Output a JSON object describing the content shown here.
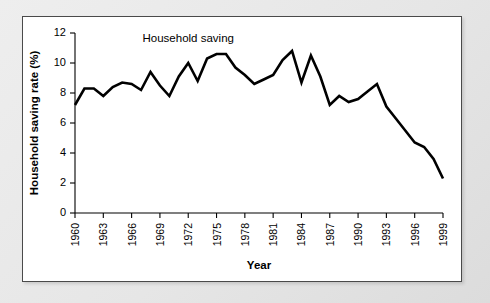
{
  "chart_data": {
    "type": "line",
    "title": "",
    "xlabel": "Year",
    "ylabel": "Household saving rate (%)",
    "xlim": [
      1960,
      1999
    ],
    "ylim": [
      0,
      12
    ],
    "yticks": [
      0,
      2,
      4,
      6,
      8,
      10,
      12
    ],
    "xticks": [
      1960,
      1963,
      1966,
      1969,
      1972,
      1975,
      1978,
      1981,
      1984,
      1987,
      1990,
      1993,
      1996,
      1999
    ],
    "grid": false,
    "legend_position": "inline-annotation",
    "annotations": [
      {
        "text": "Household saving",
        "x": 1972,
        "y": 11.4
      }
    ],
    "series": [
      {
        "name": "Household saving",
        "color": "#000000",
        "x": [
          1960,
          1961,
          1962,
          1963,
          1964,
          1965,
          1966,
          1967,
          1968,
          1969,
          1970,
          1971,
          1972,
          1973,
          1974,
          1975,
          1976,
          1977,
          1978,
          1979,
          1980,
          1981,
          1982,
          1983,
          1984,
          1985,
          1986,
          1987,
          1988,
          1989,
          1990,
          1991,
          1992,
          1993,
          1994,
          1995,
          1996,
          1997,
          1998,
          1999
        ],
        "values": [
          7.2,
          8.3,
          8.3,
          7.8,
          8.4,
          8.7,
          8.6,
          8.2,
          9.4,
          8.5,
          7.8,
          9.1,
          10.0,
          8.8,
          10.3,
          10.6,
          10.6,
          9.7,
          9.2,
          8.6,
          8.9,
          9.2,
          10.2,
          10.8,
          8.7,
          10.5,
          9.1,
          7.2,
          7.8,
          7.4,
          7.6,
          8.1,
          8.6,
          7.1,
          6.3,
          5.5,
          4.7,
          4.4,
          3.6,
          2.3
        ]
      }
    ]
  },
  "axis_labels": {
    "y": "Household saving rate (%)",
    "x": "Year"
  }
}
